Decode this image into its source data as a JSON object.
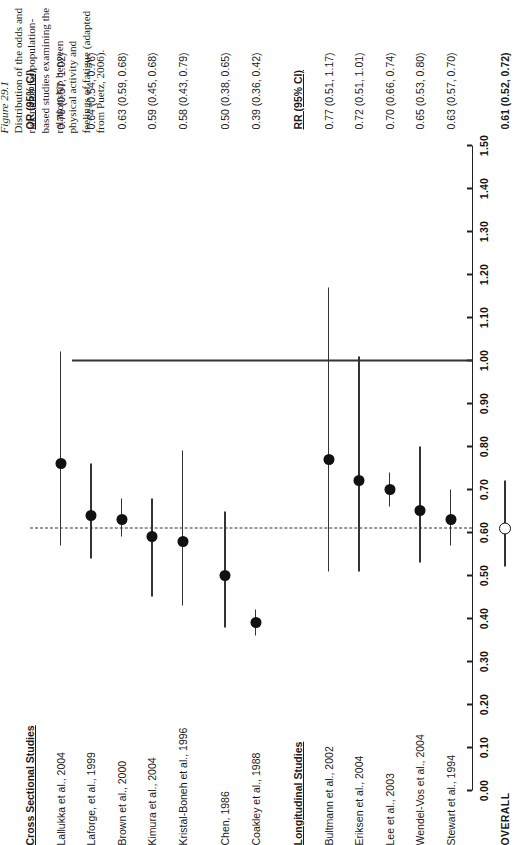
{
  "figure": {
    "caption_title": "Figure 29.1",
    "caption_body": "Distribution of the odds and risk ratios for population-based studies examining the relationship between physical activity and feelings of fatigue (adapted from Puetz, 2006)."
  },
  "columns": {
    "or_header": "OR (95% CI)",
    "rr_header": "RR (95% CI)",
    "cross_sectional_header": "Cross Sectional Studies",
    "longitudinal_header": "Longitudinal Studies",
    "overall_label": "OVERALL"
  },
  "axis": {
    "min": 0.0,
    "max": 1.5,
    "step": 0.1,
    "ticks": [
      "0.00",
      "0.10",
      "0.20",
      "0.30",
      "0.40",
      "0.50",
      "0.60",
      "0.70",
      "0.80",
      "0.90",
      "1.00",
      "1.10",
      "1.20",
      "1.30",
      "1.40",
      "1.50"
    ],
    "null_value": 1.0,
    "summary_value": 0.61
  },
  "colors": {
    "point_fill": "#111111",
    "line": "#333333",
    "text": "#1a1a1a",
    "background": "#ffffff"
  },
  "chart_data": {
    "type": "scatter",
    "title": "Distribution of the odds and risk ratios for population-based studies examining the relationship between physical activity and feelings of fatigue",
    "xlabel": "",
    "ylabel": "",
    "xlim": [
      0.0,
      1.5
    ],
    "grid": false,
    "legend": "none",
    "reference_lines": [
      {
        "value": 1.0,
        "style": "solid",
        "label": "null"
      },
      {
        "value": 0.61,
        "style": "dashed",
        "label": "overall summary"
      }
    ],
    "groups": [
      {
        "name": "Cross Sectional Studies",
        "effect_measure": "OR (95% CI)",
        "studies": [
          {
            "label": "Lallukka et al., 2004",
            "value": 0.76,
            "low": 0.57,
            "high": 1.02,
            "text": "0.76 (0.57, 1.02)"
          },
          {
            "label": "Laforge, et al., 1999",
            "value": 0.64,
            "low": 0.54,
            "high": 0.76,
            "text": "0.64 (0.54, 0.76)"
          },
          {
            "label": "Brown et al., 2000",
            "value": 0.63,
            "low": 0.59,
            "high": 0.68,
            "text": "0.63 (0.59, 0.68)"
          },
          {
            "label": "Kimura et al., 2004",
            "value": 0.59,
            "low": 0.45,
            "high": 0.68,
            "text": "0.59 (0.45, 0.68)"
          },
          {
            "label": "Kristal-Boneh et al., 1996",
            "value": 0.58,
            "low": 0.43,
            "high": 0.79,
            "text": "0.58 (0.43, 0.79)"
          },
          {
            "label": "Chen, 1986",
            "value": 0.5,
            "low": 0.38,
            "high": 0.65,
            "text": "0.50 (0.38, 0.65)"
          },
          {
            "label": "Coakley et al., 1988",
            "value": 0.39,
            "low": 0.36,
            "high": 0.42,
            "text": "0.39 (0.36, 0.42)"
          }
        ]
      },
      {
        "name": "Longitudinal Studies",
        "effect_measure": "RR (95% CI)",
        "studies": [
          {
            "label": "Bultmann et al., 2002",
            "value": 0.77,
            "low": 0.51,
            "high": 1.17,
            "text": "0.77 (0.51, 1.17)"
          },
          {
            "label": "Eriksen et al., 2004",
            "value": 0.72,
            "low": 0.51,
            "high": 1.01,
            "text": "0.72 (0.51, 1.01)"
          },
          {
            "label": "Lee et al., 2003",
            "value": 0.7,
            "low": 0.66,
            "high": 0.74,
            "text": "0.70 (0.66, 0.74)"
          },
          {
            "label": "Wendel-Vos et al., 2004",
            "value": 0.65,
            "low": 0.53,
            "high": 0.8,
            "text": "0.65 (0.53, 0.80)"
          },
          {
            "label": "Stewart et al., 1994",
            "value": 0.63,
            "low": 0.57,
            "high": 0.7,
            "text": "0.63 (0.57, 0.70)"
          }
        ]
      }
    ],
    "overall": {
      "label": "OVERALL",
      "value": 0.61,
      "low": 0.52,
      "high": 0.72,
      "text": "0.61 (0.52, 0.72)",
      "marker": "open-circle"
    }
  }
}
